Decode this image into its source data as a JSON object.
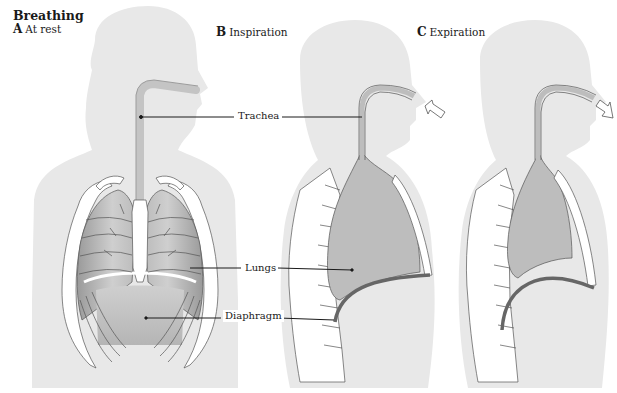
{
  "figure": {
    "title": "Breathing",
    "panels": [
      {
        "letter": "A",
        "caption": "At rest"
      },
      {
        "letter": "B",
        "caption": "Inspiration"
      },
      {
        "letter": "C",
        "caption": "Expiration"
      }
    ],
    "callouts": {
      "trachea": "Trachea",
      "lungs": "Lungs",
      "diaphragm": "Diaphragm"
    },
    "arrows": {
      "inspiration": "air-in-arrow",
      "expiration": "air-out-arrow"
    },
    "colors": {
      "body": "#e8e8e8",
      "lung": "#c4c4c4",
      "lung_dark": "#a8a8a8",
      "airway": "#bdbdbd",
      "outline": "#4a4a4a",
      "bone": "#ffffff"
    }
  }
}
